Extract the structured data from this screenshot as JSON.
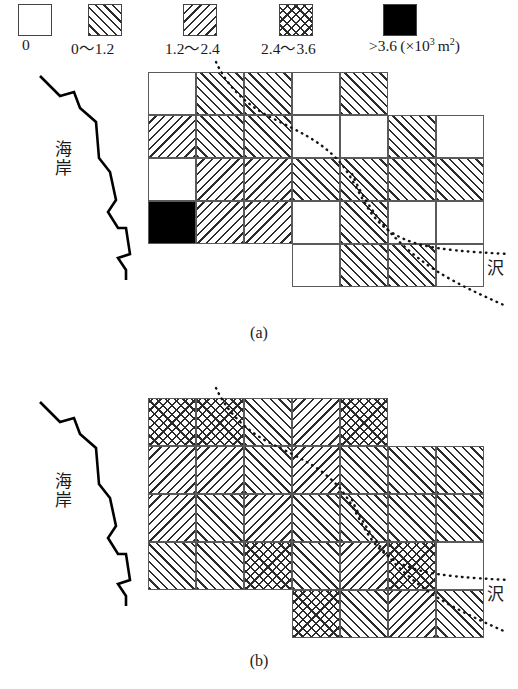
{
  "legend": {
    "items": [
      {
        "label": "0",
        "fill": "none",
        "x": 18,
        "label_x": 22
      },
      {
        "label": "0〜1.2",
        "fill": "fwd",
        "x": 88,
        "label_x": 74
      },
      {
        "label": "1.2〜2.4",
        "fill": "bwd",
        "x": 183,
        "label_x": 168
      },
      {
        "label": "2.4〜3.6",
        "fill": "cross",
        "x": 279,
        "label_x": 264
      },
      {
        "label": ">3.6",
        "fill": "solid",
        "x": 383,
        "label_x": 372
      },
      {
        "label": "(×10",
        "fill": null,
        "label_x": 420,
        "sup": "3",
        "tail": " m",
        "sup2": "2",
        "tail2": ")"
      }
    ],
    "unit_note": ">3.6 (×10³ m²)"
  },
  "panels": [
    {
      "id": "a",
      "caption": "(a)",
      "coast_label": "海岸",
      "stream_label": "沢",
      "cell_w": 48,
      "cell_h": 43,
      "origin_x": 148,
      "origin_y": 10,
      "grid": [
        {
          "row": 0,
          "col_start": 0,
          "fills": [
            "none",
            "fwd",
            "fwd",
            "none",
            "fwd"
          ]
        },
        {
          "row": 1,
          "col_start": 0,
          "fills": [
            "bwd",
            "fwd",
            "fwd",
            "none",
            "none",
            "fwd",
            "none"
          ]
        },
        {
          "row": 2,
          "col_start": 0,
          "fills": [
            "none",
            "bwd",
            "bwd",
            "fwd",
            "fwd",
            "fwd",
            "fwd"
          ]
        },
        {
          "row": 3,
          "col_start": 0,
          "fills": [
            "solid",
            "bwd",
            "bwd",
            "none",
            "fwd",
            "none",
            "none"
          ]
        },
        {
          "row": 4,
          "col_start": 3,
          "fills": [
            "none",
            "fwd",
            "fwd",
            "none"
          ]
        }
      ]
    },
    {
      "id": "b",
      "caption": "(b)",
      "coast_label": "海岸",
      "stream_label": "沢",
      "cell_w": 48,
      "cell_h": 48,
      "origin_x": 148,
      "origin_y": 30,
      "grid": [
        {
          "row": 0,
          "col_start": 0,
          "fills": [
            "cross",
            "cross",
            "fwd",
            "bwd",
            "cross"
          ]
        },
        {
          "row": 1,
          "col_start": 0,
          "fills": [
            "bwd",
            "bwd",
            "fwd",
            "bwd",
            "fwd",
            "fwd",
            "fwd"
          ]
        },
        {
          "row": 2,
          "col_start": 0,
          "fills": [
            "bwd",
            "fwd",
            "bwd",
            "fwd",
            "fwd",
            "fwd",
            "fwd"
          ]
        },
        {
          "row": 3,
          "col_start": 0,
          "fills": [
            "fwd",
            "fwd",
            "cross",
            "fwd",
            "bwd",
            "cross",
            "none"
          ]
        },
        {
          "row": 4,
          "col_start": 3,
          "fills": [
            "cross",
            "fwd",
            "bwd",
            "fwd"
          ]
        }
      ]
    }
  ]
}
